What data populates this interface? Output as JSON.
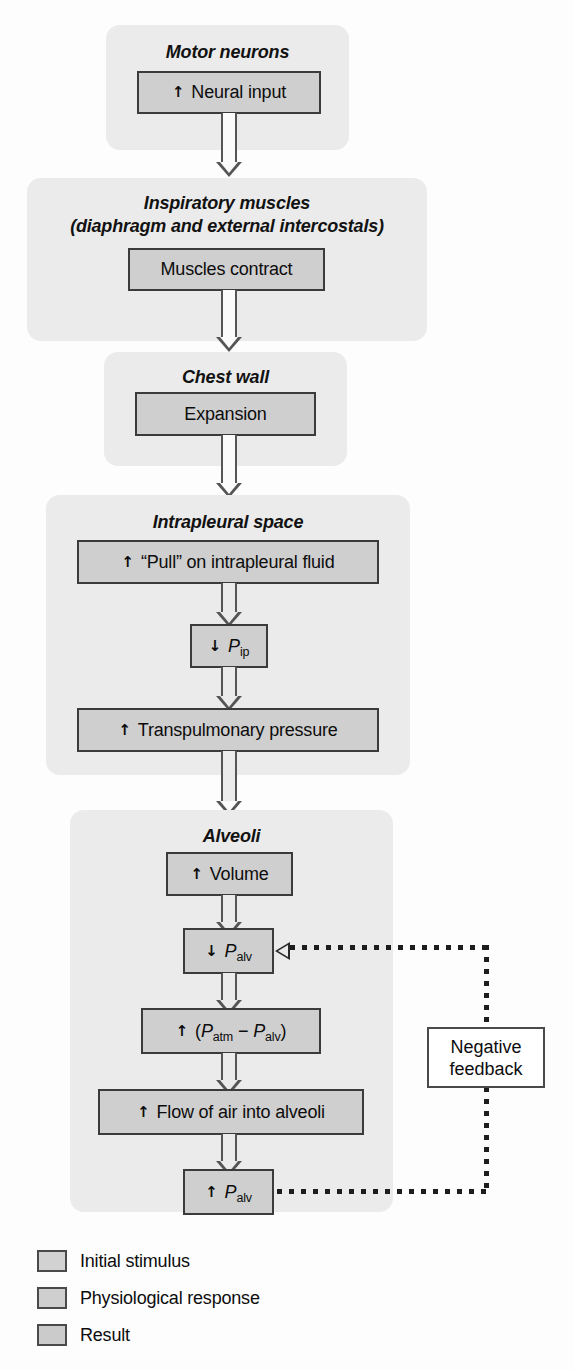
{
  "figure": {
    "colors": {
      "panel_bg": "#ebebeb",
      "box_fill": "#cfcfcf",
      "box_border": "#3b3b3b",
      "arrow": "#555555",
      "feedback_line": "#1d1d1d",
      "page_bg": "#fdfdfd"
    }
  },
  "groups": [
    {
      "id": "motor-neurons",
      "title": "Motor neurons"
    },
    {
      "id": "inspiratory-muscles",
      "title_line1": "Inspiratory muscles",
      "title_line2": "(diaphragm and external intercostals)"
    },
    {
      "id": "chest-wall",
      "title": "Chest wall"
    },
    {
      "id": "intrapleural-space",
      "title": "Intrapleural space"
    },
    {
      "id": "alveoli",
      "title": "Alveoli"
    }
  ],
  "boxes": {
    "neural_input": {
      "arrow": "↑",
      "text": "Neural input"
    },
    "muscles_contract": {
      "arrow": "",
      "text": "Muscles contract"
    },
    "expansion": {
      "arrow": "",
      "text": "Expansion"
    },
    "pull": {
      "arrow": "↑",
      "text": "“Pull” on intrapleural fluid"
    },
    "p_ip": {
      "arrow": "↓",
      "symbol": "P",
      "subscript": "ip"
    },
    "transpulmonary": {
      "arrow": "↑",
      "text": "Transpulmonary pressure"
    },
    "volume": {
      "arrow": "↑",
      "text": "Volume"
    },
    "p_alv_down": {
      "arrow": "↓",
      "symbol": "P",
      "subscript": "alv"
    },
    "p_diff": {
      "arrow": "↑",
      "open": "(",
      "symbol1": "P",
      "sub1": "atm",
      "minus": "−",
      "symbol2": "P",
      "sub2": "alv",
      "close": ")"
    },
    "flow": {
      "arrow": "↑",
      "text": "Flow of air into alveoli"
    },
    "p_alv_up": {
      "arrow": "↑",
      "symbol": "P",
      "subscript": "alv"
    }
  },
  "feedback": {
    "line1": "Negative",
    "line2": "feedback"
  },
  "legend": [
    {
      "label": "Initial stimulus",
      "color": "#d2d2d2"
    },
    {
      "label": "Physiological response",
      "color": "#cfcfcf"
    },
    {
      "label": "Result",
      "color": "#cbcbcb"
    }
  ]
}
